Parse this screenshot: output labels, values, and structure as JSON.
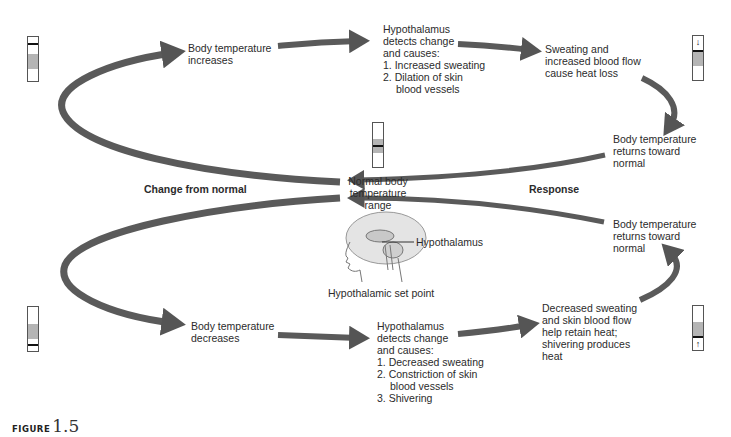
{
  "diagram": {
    "figure": {
      "word": "FIGURE",
      "number": "1.5"
    },
    "center": {
      "label_lines": [
        "Normal body",
        "temperature",
        "range"
      ],
      "head_label": "Hypothalamus",
      "set_point": "Hypothalamic set point"
    },
    "side_labels": {
      "left": "Change from normal",
      "right": "Response"
    },
    "top_loop": {
      "stimulus": [
        "Body temperature",
        "increases"
      ],
      "control": {
        "lines": [
          "Hypothalamus",
          "detects change",
          "and causes:"
        ],
        "items": [
          "1. Increased sweating",
          "2. Dilation of skin",
          "blood vessels"
        ]
      },
      "effect": [
        "Sweating and",
        "increased blood flow",
        "cause heat loss"
      ],
      "result": [
        "Body temperature",
        "returns toward",
        "normal"
      ]
    },
    "bottom_loop": {
      "stimulus": [
        "Body temperature",
        "decreases"
      ],
      "control": {
        "lines": [
          "Hypothalamus",
          "detects change",
          "and causes:"
        ],
        "items": [
          "1. Decreased sweating",
          "2. Constriction of skin",
          "blood vessels",
          "3. Shivering"
        ]
      },
      "effect": [
        "Decreased sweating",
        "and skin blood flow",
        "help retain heat;",
        "shivering produces",
        "heat"
      ],
      "result": [
        "Body temperature",
        "returns toward",
        "normal"
      ]
    },
    "thermometers": {
      "top_left": {
        "state": "high",
        "arrow": ""
      },
      "center": {
        "state": "normal",
        "arrow": ""
      },
      "top_right": {
        "state": "falling",
        "arrow": "↓"
      },
      "bottom_left": {
        "state": "low",
        "arrow": ""
      },
      "bottom_right": {
        "state": "rising",
        "arrow": "↑"
      }
    },
    "colors": {
      "arrow_fill": "#5e5e5e",
      "arrow_stroke": "#3c3c3c",
      "band": "#b5b5b5",
      "text": "#2b2b2b"
    }
  }
}
